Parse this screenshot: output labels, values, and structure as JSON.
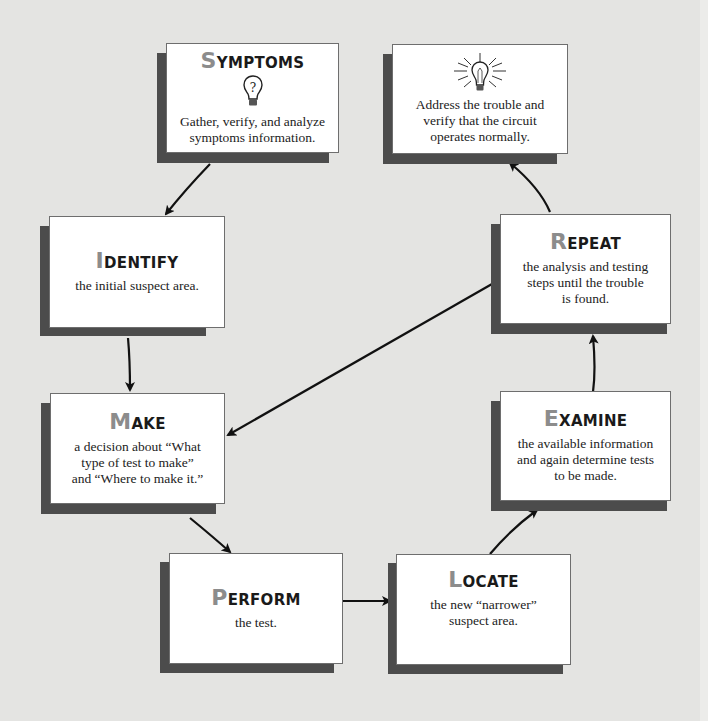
{
  "diagram": {
    "type": "troubleshooting-flowchart",
    "colors": {
      "background": "#e4e4e2",
      "box": "#ffffff",
      "shadow": "#4c4c4c",
      "title_initial": "#8c8c8c",
      "arrow": "#111111"
    },
    "steps": [
      {
        "id": "symptoms",
        "initial": "S",
        "rest": "YMPTOMS",
        "icon": "question-bulb-icon",
        "text": [
          "Gather, verify, and analyze",
          "symptoms information."
        ]
      },
      {
        "id": "identify",
        "initial": "I",
        "rest": "DENTIFY",
        "text": [
          "the initial suspect area."
        ]
      },
      {
        "id": "make",
        "initial": "M",
        "rest": "AKE",
        "text": [
          "a decision about “What",
          "type of test to make”",
          "and “Where to make it.”"
        ]
      },
      {
        "id": "perform",
        "initial": "P",
        "rest": "ERFORM",
        "text": [
          "the test."
        ]
      },
      {
        "id": "locate",
        "initial": "L",
        "rest": "OCATE",
        "text": [
          "the new “narrower”",
          "suspect area."
        ]
      },
      {
        "id": "examine",
        "initial": "E",
        "rest": "XAMINE",
        "text": [
          "the available information",
          "and again determine tests",
          "to be made."
        ]
      },
      {
        "id": "repeat",
        "initial": "R",
        "rest": "EPEAT",
        "text": [
          "the analysis and testing",
          "steps until the trouble",
          "is found."
        ]
      },
      {
        "id": "address",
        "icon": "lit-bulb-icon",
        "text": [
          "Address the trouble and",
          "verify that the circuit",
          "operates normally."
        ]
      }
    ],
    "connections": [
      {
        "from": "symptoms",
        "to": "identify"
      },
      {
        "from": "identify",
        "to": "make"
      },
      {
        "from": "make",
        "to": "perform"
      },
      {
        "from": "perform",
        "to": "locate"
      },
      {
        "from": "locate",
        "to": "examine"
      },
      {
        "from": "examine",
        "to": "repeat"
      },
      {
        "from": "repeat",
        "to": "make"
      },
      {
        "from": "repeat",
        "to": "address"
      }
    ]
  }
}
